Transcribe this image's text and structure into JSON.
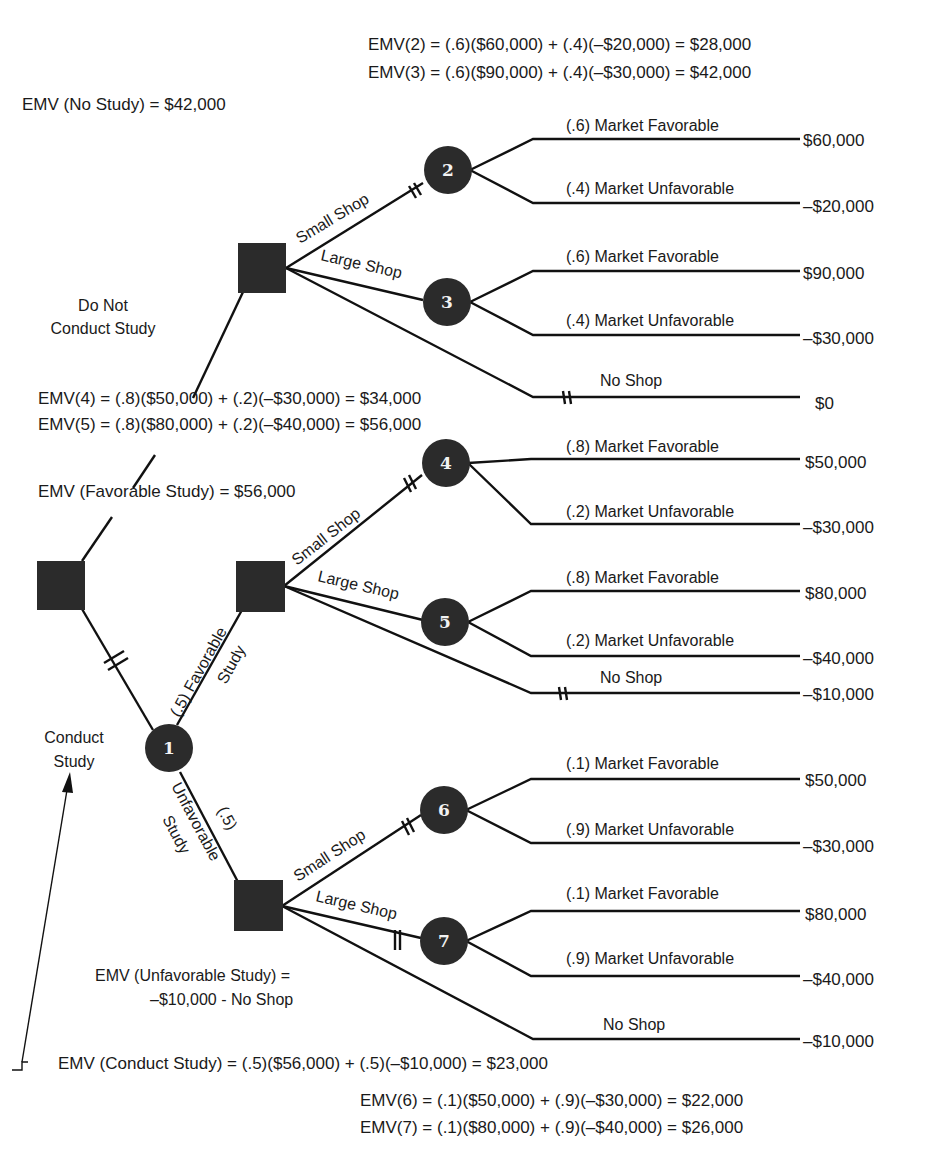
{
  "header_equations": {
    "emv2": "EMV(2) = (.6)($60,000) + (.4)(–$20,000) = $28,000",
    "emv3": "EMV(3) = (.6)($90,000) + (.4)(–$30,000) = $42,000"
  },
  "emv_no_study": "EMV (No Study) = $42,000",
  "middle_equations": {
    "emv4": "EMV(4) = (.8)($50,000) + (.2)(–$30,000) = $34,000",
    "emv5": "EMV(5) = (.8)($80,000) + (.2)(–$40,000) = $56,000"
  },
  "emv_favorable_study": "EMV (Favorable Study) = $56,000",
  "emv_unfavorable_study": {
    "line1": "EMV (Unfavorable Study) =",
    "line2": "–$10,000 - No Shop"
  },
  "emv_conduct_study": "EMV (Conduct Study) = (.5)($56,000) + (.5)(–$10,000) = $23,000",
  "bottom_equations": {
    "emv6": "EMV(6) = (.1)($50,000) + (.9)(–$30,000) = $22,000",
    "emv7": "EMV(7) = (.1)($80,000) + (.9)(–$40,000) = $26,000"
  },
  "branch_labels": {
    "do_not_conduct_line1": "Do Not",
    "do_not_conduct_line2": "Conduct Study",
    "conduct_line1": "Conduct",
    "conduct_line2": "Study",
    "favorable_line1": "(.5) Favorable",
    "favorable_line2": "Study",
    "unfavorable_prob": "(.5)",
    "unfavorable_line1": "Unfavorable",
    "unfavorable_line2": "Study",
    "small_shop": "Small Shop",
    "large_shop": "Large Shop",
    "no_shop": "No Shop"
  },
  "chance_nodes": [
    "1",
    "2",
    "3",
    "4",
    "5",
    "6",
    "7"
  ],
  "outcomes": {
    "n2": [
      {
        "label": "(.6) Market Favorable",
        "value": "$60,000"
      },
      {
        "label": "(.4) Market Unfavorable",
        "value": "–$20,000"
      }
    ],
    "n3": [
      {
        "label": "(.6) Market Favorable",
        "value": "$90,000"
      },
      {
        "label": "(.4) Market Unfavorable",
        "value": "–$30,000"
      }
    ],
    "no_shop_top": {
      "label": "No Shop",
      "value": "$0"
    },
    "n4": [
      {
        "label": "(.8) Market Favorable",
        "value": "$50,000"
      },
      {
        "label": "(.2) Market Unfavorable",
        "value": "–$30,000"
      }
    ],
    "n5": [
      {
        "label": "(.8) Market Favorable",
        "value": "$80,000"
      },
      {
        "label": "(.2) Market Unfavorable",
        "value": "–$40,000"
      }
    ],
    "no_shop_fav": {
      "label": "No Shop",
      "value": "–$10,000"
    },
    "n6": [
      {
        "label": "(.1) Market Favorable",
        "value": "$50,000"
      },
      {
        "label": "(.9) Market Unfavorable",
        "value": "–$30,000"
      }
    ],
    "n7": [
      {
        "label": "(.1) Market Favorable",
        "value": "$80,000"
      },
      {
        "label": "(.9) Market Unfavorable",
        "value": "–$40,000"
      }
    ],
    "no_shop_unfav": {
      "label": "No Shop",
      "value": "–$10,000"
    }
  }
}
